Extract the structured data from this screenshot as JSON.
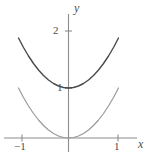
{
  "figure": {
    "title": "",
    "background_color": "#ffffff",
    "width": 149,
    "height": 160
  },
  "axes": {
    "x_axis_label": "x",
    "y_axis_label": "y",
    "axis_color": "#8c8c8c",
    "tick_color": "#8c8c8c",
    "label_color": "#4d4d4d",
    "x_ticks": [
      {
        "value": -1,
        "label": "−1"
      },
      {
        "value": 1,
        "label": "1"
      }
    ],
    "y_ticks": [
      {
        "value": 1,
        "label": "1"
      },
      {
        "value": 2,
        "label": "2"
      }
    ],
    "grid": false
  },
  "chart_data": {
    "type": "line",
    "title": "",
    "xlabel": "x",
    "ylabel": "y",
    "xlim": [
      -1.1,
      1.1
    ],
    "ylim": [
      -0.15,
      2.2
    ],
    "xticks": [
      -1,
      1
    ],
    "xticklabels": [
      "−1",
      "1"
    ],
    "yticks": [
      1,
      2
    ],
    "yticklabels": [
      "1",
      "2"
    ],
    "grid": false,
    "legend": null,
    "series": [
      {
        "name": "y = x² + 1",
        "color": "#4a4a4a",
        "linewidth": 1.4,
        "x": [
          -1.0,
          -0.9,
          -0.8,
          -0.7,
          -0.6,
          -0.5,
          -0.4,
          -0.3,
          -0.2,
          -0.1,
          0.0,
          0.1,
          0.2,
          0.3,
          0.4,
          0.5,
          0.6,
          0.7,
          0.8,
          0.9,
          1.0
        ],
        "values": [
          2.0,
          1.81,
          1.64,
          1.49,
          1.36,
          1.25,
          1.16,
          1.09,
          1.04,
          1.01,
          1.0,
          1.01,
          1.04,
          1.09,
          1.16,
          1.25,
          1.36,
          1.49,
          1.64,
          1.81,
          2.0
        ]
      },
      {
        "name": "y = x²",
        "color": "#9a9a9a",
        "linewidth": 1.2,
        "x": [
          -1.0,
          -0.9,
          -0.8,
          -0.7,
          -0.6,
          -0.5,
          -0.4,
          -0.3,
          -0.2,
          -0.1,
          0.0,
          0.1,
          0.2,
          0.3,
          0.4,
          0.5,
          0.6,
          0.7,
          0.8,
          0.9,
          1.0
        ],
        "values": [
          1.0,
          0.81,
          0.64,
          0.49,
          0.36,
          0.25,
          0.16,
          0.09,
          0.04,
          0.01,
          0.0,
          0.01,
          0.04,
          0.09,
          0.16,
          0.25,
          0.36,
          0.49,
          0.64,
          0.81,
          1.0
        ]
      }
    ]
  }
}
